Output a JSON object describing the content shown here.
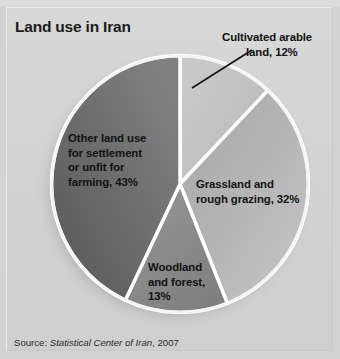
{
  "figure": {
    "title": "Land use in Iran",
    "source_prefix": "Source:",
    "source_italic": "Statistical Center of Iran",
    "source_suffix": ", 2007",
    "background_color": "#d3d3d3",
    "title_color": "#1b1b1b",
    "separator_color": "#ffffff"
  },
  "labels": {
    "arable": {
      "line1": "Cultivated arable",
      "line2": "land, 12%"
    },
    "other": {
      "line1": "Other land use",
      "line2": "for settlement",
      "line3": "or unfit for",
      "line4": "farming, 43%"
    },
    "grassland": {
      "line1": "Grassland and",
      "line2": "rough grazing, 32%"
    },
    "woodland": {
      "line1": "Woodland",
      "line2": "and forest,",
      "line3": "13%"
    }
  },
  "chart_data": {
    "type": "pie",
    "title": "Land use in Iran",
    "xlabel": "",
    "ylabel": "",
    "grid": false,
    "legend_position": "callout-labels",
    "units": "percent",
    "start_angle_deg": 0,
    "direction": "clockwise",
    "categories": [
      "Cultivated arable land",
      "Grassland and rough grazing",
      "Woodland and forest",
      "Other land use for settlement or unfit for farming"
    ],
    "values": [
      12,
      32,
      13,
      43
    ],
    "slices": [
      {
        "label": "Cultivated arable land",
        "value": 12,
        "display": "Cultivated arable land, 12%",
        "color": "#c2c2c2",
        "start_deg": 0,
        "end_deg": 43.2
      },
      {
        "label": "Grassland and rough grazing",
        "value": 32,
        "display": "Grassland and rough grazing, 32%",
        "color": "#b2b2b2",
        "start_deg": 43.2,
        "end_deg": 158.4
      },
      {
        "label": "Woodland and forest",
        "value": 13,
        "display": "Woodland and forest, 13%",
        "color": "#8a8a8a",
        "start_deg": 158.4,
        "end_deg": 205.2
      },
      {
        "label": "Other land use for settlement or unfit for farming",
        "value": 43,
        "display": "Other land use for settlement or unfit for farming, 43%",
        "color": "#6f6f6f",
        "start_deg": 205.2,
        "end_deg": 360
      }
    ],
    "total": 100,
    "source": "Source: Statistical Center of Iran, 2007"
  }
}
